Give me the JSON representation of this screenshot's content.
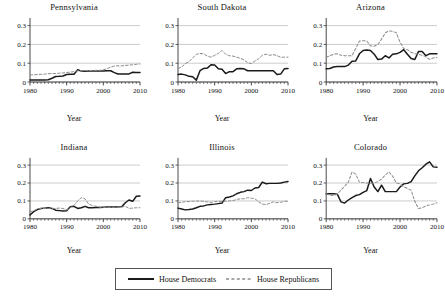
{
  "chart_data": {
    "type": "line",
    "title": "",
    "xlabel": "Year",
    "ylabel": "",
    "xlim": [
      1980,
      2010
    ],
    "ylim": [
      0,
      0.33
    ],
    "grid": true,
    "legend_position": "bottom",
    "xticks": [
      1980,
      1990,
      2000,
      2010
    ],
    "xticklabels": [
      "1980",
      "1990",
      "2000",
      "2010"
    ],
    "yticks": [
      0,
      0.1,
      0.2,
      0.3
    ],
    "yticklabels": [
      "0",
      "0.1",
      "0.2",
      "0.3"
    ],
    "legend": [
      "House Democrats",
      "House Republicans"
    ],
    "series_styles": {
      "House Democrats": "solid",
      "House Republicans": "dashed"
    },
    "colors": {
      "democrats": "#1a1a1a",
      "republicans": "#8c8c8c",
      "gridline": "#b4b4b4",
      "axis": "#333333"
    },
    "x": [
      1980,
      1981,
      1982,
      1983,
      1984,
      1985,
      1986,
      1987,
      1988,
      1989,
      1990,
      1991,
      1992,
      1993,
      1994,
      1995,
      1996,
      1997,
      1998,
      1999,
      2000,
      2001,
      2002,
      2003,
      2004,
      2005,
      2006,
      2007,
      2008,
      2009,
      2010
    ],
    "panels": [
      {
        "name": "Pennsylvania",
        "series": [
          {
            "name": "House Democrats",
            "values": [
              0.01,
              0.01,
              0.011,
              0.011,
              0.011,
              0.012,
              0.02,
              0.029,
              0.03,
              0.032,
              0.04,
              0.041,
              0.041,
              0.065,
              0.058,
              0.057,
              0.058,
              0.058,
              0.058,
              0.058,
              0.058,
              0.06,
              0.06,
              0.05,
              0.043,
              0.043,
              0.043,
              0.043,
              0.052,
              0.051,
              0.051
            ]
          },
          {
            "name": "House Republicans",
            "values": [
              0.038,
              0.038,
              0.04,
              0.041,
              0.042,
              0.044,
              0.045,
              0.045,
              0.047,
              0.048,
              0.05,
              0.053,
              0.055,
              0.06,
              0.06,
              0.06,
              0.061,
              0.061,
              0.062,
              0.062,
              0.065,
              0.07,
              0.08,
              0.085,
              0.086,
              0.086,
              0.088,
              0.09,
              0.092,
              0.094,
              0.096
            ]
          }
        ]
      },
      {
        "name": "South Dakota",
        "series": [
          {
            "name": "House Democrats",
            "values": [
              0.04,
              0.042,
              0.038,
              0.03,
              0.028,
              0.01,
              0.06,
              0.072,
              0.074,
              0.092,
              0.09,
              0.07,
              0.068,
              0.045,
              0.055,
              0.055,
              0.07,
              0.072,
              0.07,
              0.06,
              0.06,
              0.06,
              0.06,
              0.06,
              0.06,
              0.06,
              0.06,
              0.04,
              0.042,
              0.07,
              0.072
            ]
          },
          {
            "name": "House Republicans",
            "values": [
              0.072,
              0.08,
              0.098,
              0.108,
              0.128,
              0.148,
              0.152,
              0.15,
              0.138,
              0.132,
              0.142,
              0.152,
              0.168,
              0.148,
              0.14,
              0.138,
              0.132,
              0.126,
              0.118,
              0.102,
              0.098,
              0.112,
              0.124,
              0.142,
              0.148,
              0.142,
              0.146,
              0.14,
              0.132,
              0.132,
              0.132
            ]
          }
        ]
      },
      {
        "name": "Arizona",
        "series": [
          {
            "name": "House Democrats",
            "values": [
              0.07,
              0.072,
              0.08,
              0.082,
              0.082,
              0.082,
              0.09,
              0.11,
              0.112,
              0.15,
              0.168,
              0.17,
              0.168,
              0.148,
              0.12,
              0.122,
              0.14,
              0.128,
              0.148,
              0.15,
              0.158,
              0.172,
              0.148,
              0.125,
              0.12,
              0.162,
              0.162,
              0.14,
              0.15,
              0.15,
              0.15
            ]
          },
          {
            "name": "House Republicans",
            "values": [
              0.132,
              0.14,
              0.148,
              0.15,
              0.142,
              0.14,
              0.14,
              0.14,
              0.178,
              0.218,
              0.22,
              0.218,
              0.192,
              0.19,
              0.2,
              0.228,
              0.262,
              0.272,
              0.27,
              0.262,
              0.212,
              0.178,
              0.172,
              0.158,
              0.15,
              0.148,
              0.142,
              0.135,
              0.12,
              0.128,
              0.13
            ]
          }
        ]
      },
      {
        "name": "Indiana",
        "series": [
          {
            "name": "House Democrats",
            "values": [
              0.022,
              0.04,
              0.052,
              0.058,
              0.06,
              0.062,
              0.058,
              0.048,
              0.046,
              0.044,
              0.045,
              0.068,
              0.07,
              0.058,
              0.062,
              0.07,
              0.062,
              0.062,
              0.063,
              0.063,
              0.065,
              0.066,
              0.066,
              0.066,
              0.066,
              0.068,
              0.09,
              0.105,
              0.098,
              0.126,
              0.127
            ]
          },
          {
            "name": "House Republicans",
            "values": [
              0.04,
              0.045,
              0.055,
              0.058,
              0.058,
              0.058,
              0.058,
              0.058,
              0.06,
              0.058,
              0.05,
              0.062,
              0.075,
              0.1,
              0.118,
              0.112,
              0.082,
              0.074,
              0.07,
              0.065,
              0.064,
              0.064,
              0.064,
              0.064,
              0.064,
              0.066,
              0.07,
              0.058,
              0.06,
              0.062,
              0.062
            ]
          }
        ]
      },
      {
        "name": "Illinois",
        "series": [
          {
            "name": "House Democrats",
            "values": [
              0.06,
              0.055,
              0.05,
              0.052,
              0.055,
              0.062,
              0.07,
              0.072,
              0.078,
              0.08,
              0.082,
              0.085,
              0.088,
              0.118,
              0.122,
              0.128,
              0.14,
              0.148,
              0.152,
              0.16,
              0.158,
              0.172,
              0.175,
              0.205,
              0.196,
              0.198,
              0.198,
              0.198,
              0.2,
              0.205,
              0.208
            ]
          },
          {
            "name": "House Republicans",
            "values": [
              0.09,
              0.092,
              0.096,
              0.097,
              0.098,
              0.099,
              0.099,
              0.098,
              0.094,
              0.092,
              0.096,
              0.098,
              0.098,
              0.098,
              0.1,
              0.102,
              0.108,
              0.112,
              0.112,
              0.118,
              0.115,
              0.112,
              0.095,
              0.082,
              0.08,
              0.086,
              0.095,
              0.09,
              0.092,
              0.098,
              0.098
            ]
          }
        ]
      },
      {
        "name": "Colorado",
        "series": [
          {
            "name": "House Democrats",
            "values": [
              0.14,
              0.14,
              0.14,
              0.138,
              0.095,
              0.088,
              0.105,
              0.118,
              0.13,
              0.135,
              0.148,
              0.158,
              0.225,
              0.178,
              0.152,
              0.188,
              0.152,
              0.152,
              0.152,
              0.152,
              0.178,
              0.195,
              0.198,
              0.208,
              0.24,
              0.268,
              0.285,
              0.305,
              0.318,
              0.29,
              0.288
            ]
          },
          {
            "name": "House Republicans",
            "values": [
              0.14,
              0.132,
              0.13,
              0.138,
              0.16,
              0.182,
              0.205,
              0.262,
              0.25,
              0.205,
              0.202,
              0.2,
              0.198,
              0.2,
              0.208,
              0.222,
              0.245,
              0.262,
              0.238,
              0.2,
              0.195,
              0.178,
              0.17,
              0.16,
              0.098,
              0.058,
              0.062,
              0.072,
              0.078,
              0.082,
              0.09
            ]
          }
        ]
      }
    ]
  }
}
